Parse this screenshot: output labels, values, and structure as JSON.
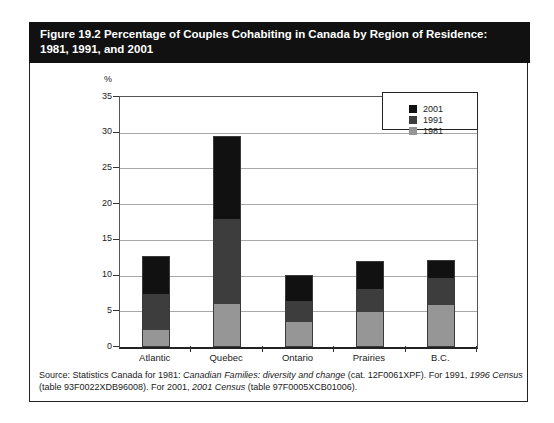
{
  "figure": {
    "title": "Figure 19.2 Percentage of Couples Cohabiting in Canada by Region of Residence: 1981, 1991, and 2001"
  },
  "chart_data": {
    "type": "bar",
    "stack_style": "overlay-cumulative",
    "title": "Percentage of Couples Cohabiting in Canada by Region of Residence: 1981, 1991, and 2001",
    "unit_label": "%",
    "xlabel": "",
    "ylabel": "%",
    "categories": [
      "Atlantic",
      "Quebec",
      "Ontario",
      "Prairies",
      "B.C."
    ],
    "series": [
      {
        "name": "1981",
        "color": "#969696",
        "values": [
          2.3,
          6.0,
          3.4,
          4.9,
          5.9
        ]
      },
      {
        "name": "1991",
        "color": "#3d3d3d",
        "values": [
          7.4,
          18.0,
          6.5,
          8.2,
          9.8
        ]
      },
      {
        "name": "2001",
        "color": "#111111",
        "values": [
          12.8,
          29.5,
          10.1,
          12.0,
          12.2
        ]
      }
    ],
    "ylim": [
      0,
      35
    ],
    "yticks": [
      0,
      5,
      10,
      15,
      20,
      25,
      30,
      35
    ],
    "grid": true,
    "legend_position": "top-right",
    "legend_order": [
      "2001",
      "1991",
      "1981"
    ]
  },
  "source": {
    "segments": [
      {
        "text": "Source: Statistics Canada for 1981: ",
        "italic": false
      },
      {
        "text": "Canadian Families: diversity and change",
        "italic": true
      },
      {
        "text": " (cat. 12F0061XPF). For 1991, ",
        "italic": false
      },
      {
        "text": "1996 Census",
        "italic": true
      },
      {
        "text": " (table 93F0022XDB96008). For 2001, ",
        "italic": false
      },
      {
        "text": "2001 Census",
        "italic": true
      },
      {
        "text": " (table 97F0005XCB01006).",
        "italic": false
      }
    ]
  }
}
